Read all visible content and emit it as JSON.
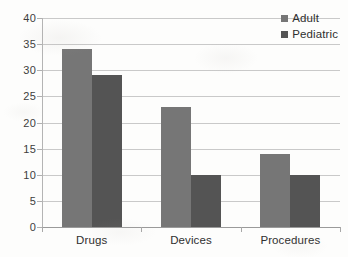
{
  "chart_data": {
    "type": "bar",
    "title": "",
    "subtitle": "",
    "xlabel": "",
    "ylabel": "",
    "categories": [
      "Drugs",
      "Devices",
      "Procedures"
    ],
    "series": [
      {
        "name": "Adult",
        "values": [
          34,
          23,
          14
        ],
        "color": "#767676"
      },
      {
        "name": "Pediatric",
        "values": [
          29,
          10,
          10
        ],
        "color": "#545454"
      }
    ],
    "ylim": [
      0,
      40
    ],
    "ytick_step": 5,
    "yticks": [
      0,
      5,
      10,
      15,
      20,
      25,
      30,
      35,
      40
    ],
    "ytick_labels": [
      "0",
      "5",
      "10",
      "15",
      "20",
      "25",
      "30",
      "35",
      "40"
    ],
    "grid": "horizontal",
    "grid_color": "#c9c9c9",
    "legend_position": "top-right",
    "bar_grouping": "grouped",
    "annotations": []
  },
  "legend": {
    "items": [
      {
        "label": "Adult",
        "swatch": "legend-swatch-adult"
      },
      {
        "label": "Pediatric",
        "swatch": "legend-swatch-pediatric"
      }
    ]
  },
  "colors": {
    "adult": "#767676",
    "pediatric": "#545454",
    "gridline": "#c9c9c9",
    "axis": "#9a9a9a",
    "background": "#ffffff",
    "text": "#2f2f2f"
  }
}
